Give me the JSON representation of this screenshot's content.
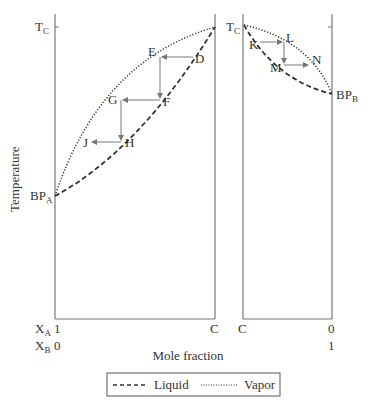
{
  "diagram": {
    "left_panel": {
      "top_label": "T",
      "top_label_sub": "C",
      "bottom_label": "BP",
      "bottom_label_sub": "A",
      "x_left_tick": "1",
      "x_right_tick": "C",
      "xb_left_tick": "0",
      "points": {
        "D": "D",
        "E": "E",
        "F": "F",
        "G": "G",
        "H": "H",
        "J": "J"
      }
    },
    "right_panel": {
      "top_label": "T",
      "top_label_sub": "C",
      "bottom_label": "BP",
      "bottom_label_sub": "B",
      "x_left_tick": "C",
      "x_right_tick": "0",
      "xb_right_tick": "1",
      "points": {
        "K": "K",
        "L": "L",
        "M": "M",
        "N": "N"
      }
    },
    "y_axis_label": "Temperature",
    "x_axis_label": "Mole fraction",
    "xa_label": "X",
    "xa_sub": "A",
    "xb_label": "X",
    "xb_sub": "B",
    "legend": {
      "liquid": "Liquid",
      "vapor": "Vapor"
    },
    "colors": {
      "line": "#333333",
      "arrow": "#777777"
    }
  }
}
